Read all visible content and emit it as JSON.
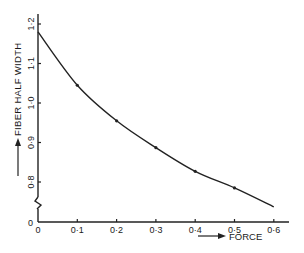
{
  "chart_data": {
    "type": "line",
    "title": "",
    "xlabel": "FORCE",
    "ylabel": "FIBER HALF WIDTH",
    "x_ticks": [
      0,
      0.1,
      0.2,
      0.3,
      0.4,
      0.5,
      0.6
    ],
    "x_tick_labels": [
      "0",
      "0·1",
      "0·2",
      "0·3",
      "0·4",
      "0·5",
      "0·6"
    ],
    "y_ticks": [
      0.8,
      0.9,
      1.0,
      1.1,
      1.2
    ],
    "y_tick_labels": [
      "0·8",
      "0·9",
      "1·0",
      "1·1",
      "1·2"
    ],
    "y_origin_label": "0",
    "xlim": [
      0,
      0.64
    ],
    "ylim": [
      0.7,
      1.2
    ],
    "y_axis_break": true,
    "grid": false,
    "legend": null,
    "series": [
      {
        "name": "fiber half width vs force",
        "x": [
          0,
          0.1,
          0.2,
          0.3,
          0.4,
          0.5,
          0.6
        ],
        "y": [
          1.18,
          1.045,
          0.955,
          0.887,
          0.827,
          0.785,
          0.737
        ],
        "markers": [
          false,
          true,
          true,
          true,
          true,
          true,
          false
        ]
      }
    ],
    "colors": {
      "line": "#222222",
      "axis": "#222222",
      "background": "#ffffff"
    }
  }
}
